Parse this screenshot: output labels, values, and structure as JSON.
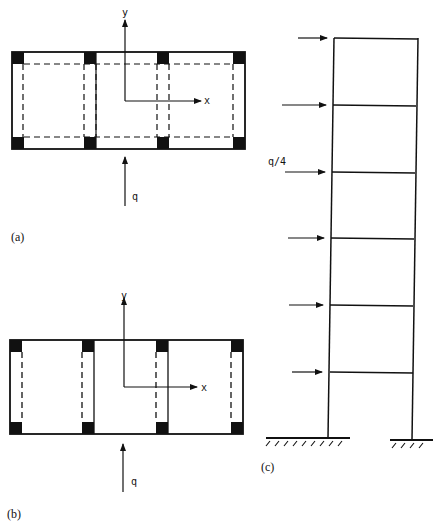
{
  "panels": {
    "a": {
      "label": "(a)",
      "axis_y": "y",
      "axis_x": "x",
      "load": "q",
      "description": "Plan view: three-bay rectangular building with corner columns and dashed inner frame lines in both directions"
    },
    "b": {
      "label": "(b)",
      "axis_y": "y",
      "axis_x": "x",
      "load": "q",
      "description": "Plan view: three-bay building with shear walls (dashed) between columns in the y-direction only"
    },
    "c": {
      "label": "(c)",
      "load": "q/4",
      "stories": 6,
      "description": "Elevation of a six-storey frame with lateral point loads at each floor, fixed supports at base"
    }
  },
  "colors": {
    "ink": "#111111",
    "background": "#ffffff"
  }
}
